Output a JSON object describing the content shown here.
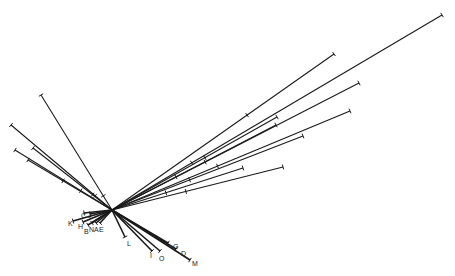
{
  "diagram": {
    "type": "unrooted-tree",
    "center": [
      112,
      210
    ],
    "line_color": "#1a1a1a",
    "branches": [
      {
        "end": [
          442,
          15
        ],
        "tick": [
          190,
          160
        ]
      },
      {
        "end": [
          334,
          54
        ],
        "tick": [
          247,
          115
        ]
      },
      {
        "end": [
          359,
          83
        ],
        "tick": [
          200,
          152
        ]
      },
      {
        "end": [
          350,
          111
        ],
        "tick": [
          215,
          160
        ]
      },
      {
        "end": [
          277,
          117
        ],
        "tick": [
          205,
          158
        ]
      },
      {
        "end": [
          276,
          125
        ],
        "tick": [
          175,
          175
        ]
      },
      {
        "end": [
          303,
          136
        ],
        "tick": [
          185,
          168
        ]
      },
      {
        "end": [
          283,
          167
        ],
        "tick": [
          185,
          188
        ]
      },
      {
        "end": [
          243,
          168
        ],
        "tick": [
          165,
          190
        ]
      },
      {
        "end": [
          41,
          95
        ],
        "tick": [
          103,
          196
        ]
      },
      {
        "end": [
          11,
          125
        ],
        "tick": [
          95,
          196
        ]
      },
      {
        "end": [
          33,
          148
        ],
        "tick": [
          90,
          198
        ]
      },
      {
        "end": [
          15,
          150
        ],
        "tick": [
          80,
          192
        ]
      },
      {
        "end": [
          28,
          160
        ],
        "tick": [
          60,
          186
        ]
      }
    ],
    "leaves": [
      {
        "label": "C",
        "end": [
          84,
          213
        ],
        "pos": [
          81,
          215
        ]
      },
      {
        "label": "J",
        "end": [
          90,
          214
        ],
        "pos": [
          88,
          215
        ]
      },
      {
        "label": "K",
        "end": [
          73,
          221
        ],
        "pos": [
          68,
          223
        ]
      },
      {
        "label": "H",
        "end": [
          83,
          222
        ],
        "pos": [
          78,
          226
        ]
      },
      {
        "label": "B",
        "end": [
          88,
          225
        ],
        "pos": [
          84,
          231
        ]
      },
      {
        "label": "N",
        "end": [
          92,
          223
        ],
        "pos": [
          89,
          229
        ]
      },
      {
        "label": "A",
        "end": [
          96,
          223
        ],
        "pos": [
          94,
          229
        ]
      },
      {
        "label": "E",
        "end": [
          100,
          223
        ],
        "pos": [
          99,
          229
        ]
      },
      {
        "label": "L",
        "end": [
          125,
          237
        ],
        "pos": [
          127,
          243
        ]
      },
      {
        "label": "I",
        "end": [
          152,
          251
        ],
        "pos": [
          150,
          255
        ]
      },
      {
        "label": "O",
        "end": [
          160,
          251
        ],
        "pos": [
          159,
          258
        ]
      },
      {
        "label": "G",
        "end": [
          168,
          243
        ],
        "pos": [
          173,
          246
        ]
      },
      {
        "label": "D",
        "end": [
          176,
          249
        ],
        "pos": [
          181,
          253
        ]
      },
      {
        "label": "M",
        "end": [
          190,
          260
        ],
        "pos": [
          192,
          263
        ]
      }
    ]
  }
}
